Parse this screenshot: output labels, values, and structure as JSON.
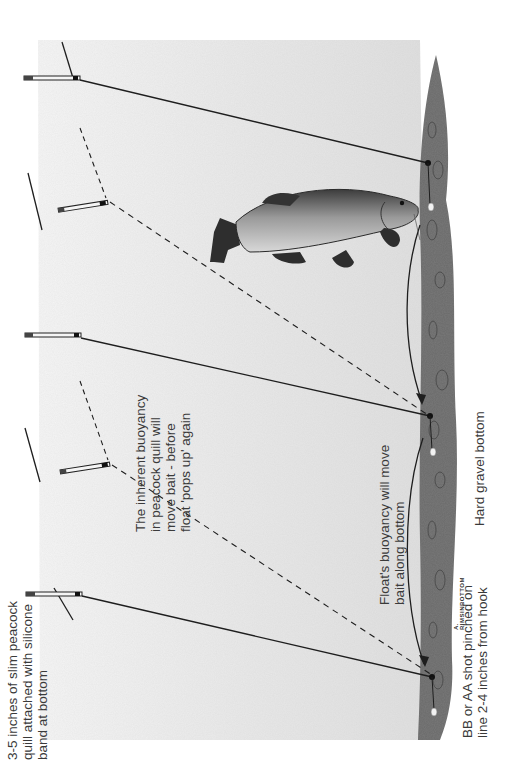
{
  "diagram": {
    "orientation": "rotated 90° counter-clockwise",
    "colors": {
      "background": "#ffffff",
      "water_wash": "#e4e4e4",
      "line": "#1e1e1e",
      "gravel": "#555555",
      "text": "#3a3a3a",
      "fish_body": "#8a8a8a"
    },
    "labels": {
      "quill": {
        "lines": [
          "3-5 inches of slim peacock",
          "quill attached with silicone",
          "band at bottom"
        ]
      },
      "buoyancy_inherent": {
        "lines": [
          "The inherent buoyancy",
          "in peacock quill will",
          "move bait - before",
          "float 'pops up' again"
        ]
      },
      "float_buoyancy": {
        "lines": [
          "Float's buoyancy will move",
          "bait along bottom"
        ]
      },
      "shot": {
        "lines": [
          "BB or AA shot pinched on",
          "line 2-4 inches from hook"
        ]
      },
      "bottom": {
        "lines": [
          "Hard gravel bottom"
        ]
      },
      "signature": "A. RIMSINBOTTOM"
    },
    "elements": [
      {
        "name": "float-upright-left",
        "state": "standing"
      },
      {
        "name": "float-tilted-left",
        "state": "pulled under"
      },
      {
        "name": "float-upright-middle",
        "state": "standing"
      },
      {
        "name": "float-tilted-right",
        "state": "pulled under"
      },
      {
        "name": "float-upright-right",
        "state": "standing"
      },
      {
        "name": "tench-fish",
        "state": "feeding at bottom"
      }
    ]
  }
}
